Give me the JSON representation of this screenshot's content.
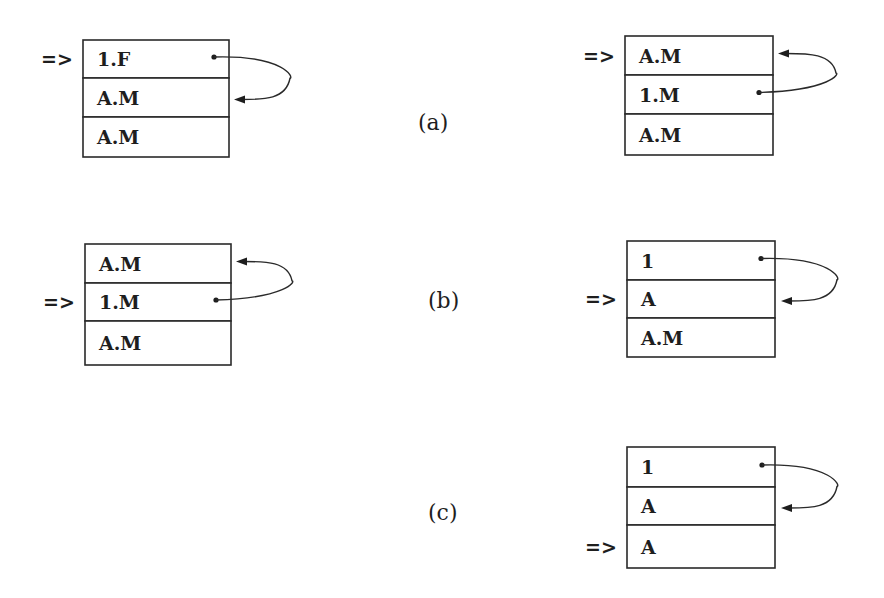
{
  "diagram": {
    "labels": [
      {
        "id": "a",
        "text": "(a)",
        "x": 418,
        "y": 130
      },
      {
        "id": "b",
        "text": "(b)",
        "x": 428,
        "y": 308
      },
      {
        "id": "c",
        "text": "(c)",
        "x": 428,
        "y": 520
      }
    ],
    "stacks": [
      {
        "id": "a-left",
        "row": "a",
        "x": 83,
        "y": 40,
        "width": 146,
        "row_heights": [
          38,
          39,
          40
        ],
        "cells": [
          "1.F",
          "A.M",
          "A.M"
        ],
        "pointer": {
          "text": "=>",
          "row_index": 0
        },
        "link": {
          "from_row": 0,
          "to_row": 1,
          "dot_x": 214,
          "arrow_x": 234,
          "bulge_x": 290
        }
      },
      {
        "id": "a-right",
        "row": "a",
        "x": 625,
        "y": 36,
        "width": 148,
        "row_heights": [
          39,
          39,
          41
        ],
        "cells": [
          "A.M",
          "1.M",
          "A.M"
        ],
        "pointer": {
          "text": "=>",
          "row_index": 0
        },
        "link": {
          "from_row": 1,
          "to_row": 0,
          "dot_x": 759,
          "arrow_x": 778,
          "bulge_x": 836
        }
      },
      {
        "id": "b-left",
        "row": "b",
        "x": 85,
        "y": 244,
        "width": 146,
        "row_heights": [
          39,
          38,
          44
        ],
        "cells": [
          "A.M",
          "1.M",
          "A.M"
        ],
        "pointer": {
          "text": "=>",
          "row_index": 1
        },
        "link": {
          "from_row": 1,
          "to_row": 0,
          "dot_x": 216,
          "arrow_x": 236,
          "bulge_x": 292
        }
      },
      {
        "id": "b-right",
        "row": "b",
        "x": 627,
        "y": 241,
        "width": 148,
        "row_heights": [
          39,
          38,
          39
        ],
        "cells": [
          "1",
          "A",
          "A.M"
        ],
        "pointer": {
          "text": "=>",
          "row_index": 1
        },
        "link": {
          "from_row": 0,
          "to_row": 1,
          "dot_x": 761,
          "arrow_x": 781,
          "bulge_x": 837
        }
      },
      {
        "id": "c-right",
        "row": "c",
        "x": 627,
        "y": 447,
        "width": 148,
        "row_heights": [
          40,
          38,
          43
        ],
        "cells": [
          "1",
          "A",
          "A"
        ],
        "pointer": {
          "text": "=>",
          "row_index": 2
        },
        "link": {
          "from_row": 0,
          "to_row": 1,
          "dot_x": 762,
          "arrow_x": 781,
          "bulge_x": 837
        }
      }
    ]
  }
}
